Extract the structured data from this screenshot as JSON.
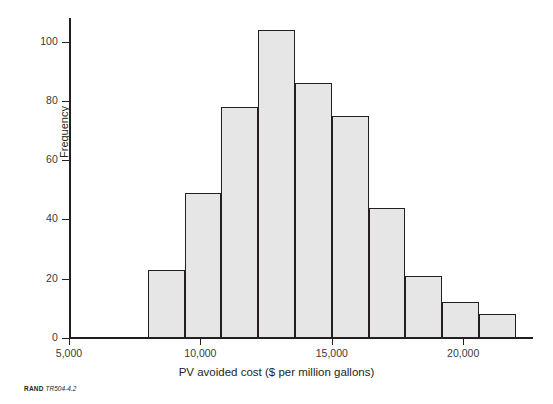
{
  "figure": {
    "source_brand": "RAND",
    "source_id": "TR504-4.2"
  },
  "chart_data": {
    "type": "bar",
    "title": "",
    "subtitle": "",
    "xlabel": "PV avoided cost ($ per million gallons)",
    "ylabel": "Frequency",
    "xlim": [
      5000,
      22200
    ],
    "ylim": [
      0,
      107
    ],
    "grid": false,
    "legend": null,
    "bar_style": {
      "fill": "#e6e6e6",
      "stroke": "#231f20"
    },
    "bin_edges": [
      8000,
      9400,
      10800,
      12200,
      13600,
      15000,
      16400,
      17800,
      19200,
      20600,
      22000
    ],
    "categories": [
      "8,000-9,400",
      "9,400-10,800",
      "10,800-12,200",
      "12,200-13,600",
      "13,600-15,000",
      "15,000-16,400",
      "16,400-17,800",
      "17,800-19,200",
      "19,200-20,600",
      "20,600-22,000"
    ],
    "values": [
      23,
      49,
      78,
      104,
      86,
      75,
      44,
      21,
      12,
      8
    ],
    "xticks": [
      5000,
      10000,
      15000,
      20000
    ],
    "xticklabels": [
      "5,000",
      "10,000",
      "15,000",
      "20,000"
    ],
    "yticks": [
      0,
      20,
      40,
      60,
      80,
      100
    ],
    "yticklabels": [
      "0",
      "20",
      "40",
      "60",
      "80",
      "100"
    ]
  }
}
